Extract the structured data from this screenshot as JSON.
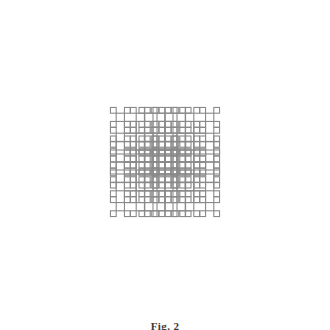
{
  "figure": {
    "caption": "Fig. 2",
    "background_color": "#ffffff",
    "stroke_color": "#8a8a8a",
    "stroke_width": 1.1,
    "canvas": {
      "width": 330,
      "height": 328
    }
  },
  "chart_data": {
    "type": "diagram",
    "subtype": "recursive-square-x-tree-fractal",
    "symmetry": "4-fold (D4): horizontal, vertical and both diagonal mirrors",
    "shape_primitive": "square outline (no fill)",
    "fill": "none",
    "stroke_color": "#8a8a8a",
    "stroke_width": 1.1,
    "background": "#ffffff",
    "center": {
      "x": 165,
      "y": 162
    },
    "root_square_size": 24,
    "scale_ratio": 0.7,
    "recursion_depth": 4,
    "branch_directions": [
      {
        "name": "up-left",
        "dx": -1,
        "dy": -1
      },
      {
        "name": "up-right",
        "dx": 1,
        "dy": -1
      },
      {
        "name": "down-left",
        "dx": -1,
        "dy": 1
      },
      {
        "name": "down-right",
        "dx": 1,
        "dy": 1
      }
    ],
    "levels": [
      {
        "level": 0,
        "square_size": 24.0,
        "square_count": 1
      },
      {
        "level": 1,
        "square_size": 16.8,
        "square_count": 4
      },
      {
        "level": 2,
        "square_size": 11.8,
        "square_count": 16
      },
      {
        "level": 3,
        "square_size": 8.2,
        "square_count": 64
      }
    ],
    "total_squares": 85,
    "bounding_box": {
      "x_min": 14,
      "y_min": 12,
      "x_max": 316,
      "y_max": 312
    },
    "xlabel": "",
    "ylabel": "",
    "grid": false,
    "legend": false,
    "axes_visible": false
  }
}
